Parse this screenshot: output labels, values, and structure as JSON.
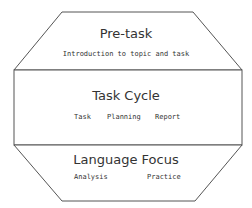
{
  "diagram": {
    "sections": [
      {
        "title": "Pre-task",
        "subtitle": "Introduction to topic and task"
      },
      {
        "title": "Task Cycle",
        "items": [
          "Task",
          "Planning",
          "Report"
        ]
      },
      {
        "title": "Language Focus",
        "items": [
          "Analysis",
          "Practice"
        ]
      }
    ],
    "colors": {
      "stroke": "#555555",
      "text": "#333333",
      "background": "#ffffff"
    }
  }
}
